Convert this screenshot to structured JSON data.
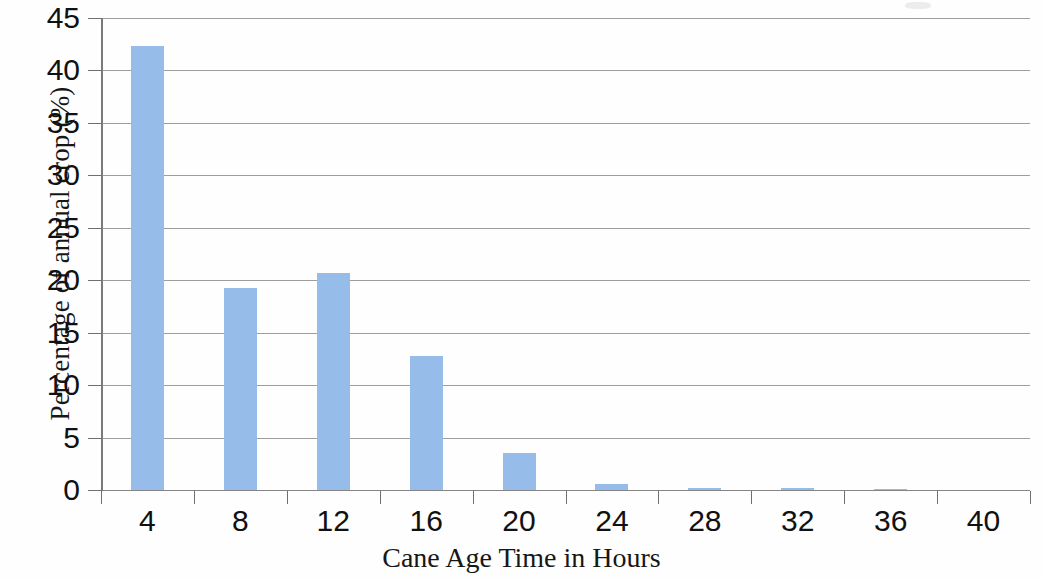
{
  "chart_data": {
    "type": "bar",
    "title": "",
    "xlabel": "Cane Age Time in Hours",
    "ylabel": "Percentage of annual crop (%)",
    "categories": [
      "4",
      "8",
      "12",
      "16",
      "20",
      "24",
      "28",
      "32",
      "36",
      "40"
    ],
    "values": [
      42.3,
      19.3,
      20.7,
      12.8,
      3.5,
      0.6,
      0.15,
      0.2,
      0.12,
      0
    ],
    "ylim": [
      0,
      45
    ],
    "ytick_labels": [
      "0",
      "5",
      "10",
      "15",
      "20",
      "25",
      "30",
      "35",
      "40",
      "45"
    ],
    "ytick_values": [
      0,
      5,
      10,
      15,
      20,
      25,
      30,
      35,
      40,
      45
    ],
    "xtick_labels": [
      "4",
      "8",
      "12",
      "16",
      "20",
      "24",
      "28",
      "32",
      "36",
      "40"
    ],
    "grid": true,
    "legend": null,
    "bar_color": "#96bdea",
    "grid_color": "#8c8c8c",
    "axis_color": "#6f6f6f",
    "text_color": "#111111"
  }
}
